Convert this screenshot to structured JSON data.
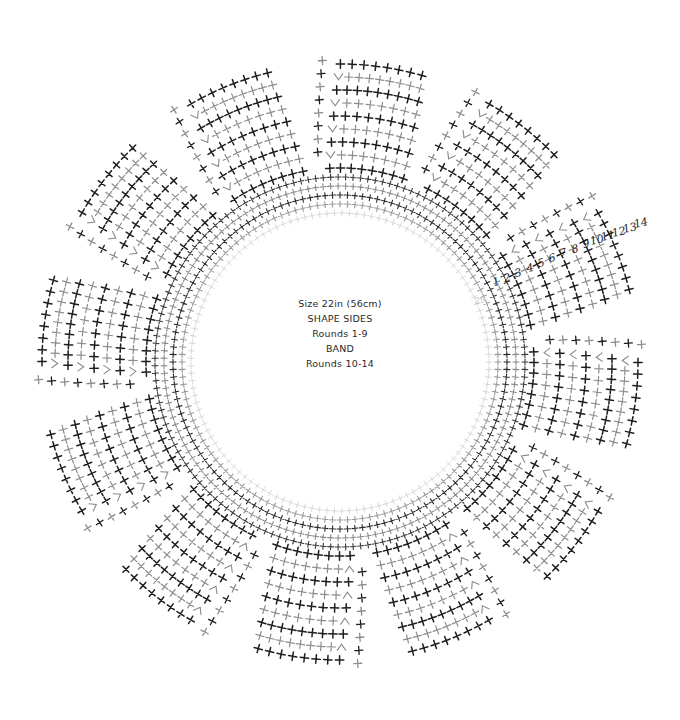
{
  "diagram": {
    "title_lines": [
      "Size 22in (56cm)",
      "SHAPE SIDES",
      "Rounds 1-9",
      "BAND",
      "Rounds 10-14"
    ],
    "center": [
      340,
      362
    ],
    "inner_radius": 146,
    "band": {
      "rounds": 5,
      "ring_spacing": 9,
      "stitch_spacing": 7.5,
      "colors": [
        "#cfcfcf",
        "#9a9a9a",
        "#2a2a2a",
        "#8a8a8a",
        "#3a3a3a"
      ]
    },
    "wedges": {
      "count": 12,
      "start_angle_deg": -82,
      "span_deg": 22,
      "rows": 9,
      "row_spacing": 13,
      "stitches_base": 5,
      "colors": [
        "#1e1e1e",
        "#8c8c8c"
      ]
    },
    "round_labels": {
      "values": [
        "1",
        "2",
        "3",
        "4",
        "5",
        "6",
        "7",
        "8",
        "9",
        "10",
        "11",
        "12",
        "13",
        "14"
      ],
      "positions": [
        [
          496,
          282
        ],
        [
          507,
          278
        ],
        [
          518,
          273
        ],
        [
          530,
          268
        ],
        [
          541,
          263
        ],
        [
          552,
          258
        ],
        [
          563,
          253
        ],
        [
          575,
          249
        ],
        [
          586,
          244
        ],
        [
          597,
          240
        ],
        [
          608,
          236
        ],
        [
          619,
          232
        ],
        [
          630,
          228
        ],
        [
          641,
          223
        ]
      ],
      "faint_label": "29",
      "faint_position": [
        480,
        300
      ]
    },
    "symbols": {
      "stitch": "single-crochet-cross",
      "decrease": "sc2tog-v"
    }
  }
}
